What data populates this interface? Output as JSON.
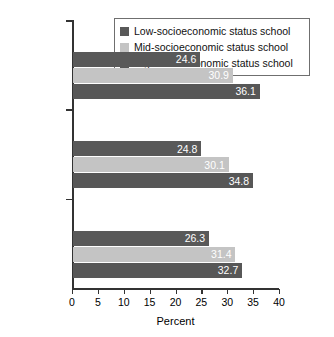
{
  "chart_data": {
    "type": "bar",
    "orientation": "horizontal",
    "title": "",
    "subtitle": "",
    "xlabel": "Percent",
    "ylabel": "",
    "xlim": [
      0,
      40
    ],
    "xticks": [
      0,
      5,
      10,
      15,
      20,
      25,
      30,
      35,
      40
    ],
    "grid": false,
    "legend_position": "top-right",
    "categories": [
      "8th grade",
      "10th grade",
      "12th grade"
    ],
    "series": [
      {
        "name": "Low-socioeconomic status school",
        "color": "#595959",
        "values": [
          24.6,
          24.8,
          26.3
        ]
      },
      {
        "name": "Mid-socioeconomic status school",
        "color": "#c4c4c4",
        "values": [
          30.9,
          30.1,
          31.4
        ]
      },
      {
        "name": "High-socioeconomic status school",
        "color": "#575757",
        "values": [
          36.1,
          34.8,
          32.7
        ]
      }
    ],
    "value_labels": {
      "8th grade": [
        "24.6",
        "30.9",
        "36.1"
      ],
      "10th grade": [
        "24.8",
        "30.1",
        "34.8"
      ],
      "12th grade": [
        "26.3",
        "31.4",
        "32.7"
      ]
    },
    "axis_color": "#333333",
    "background": "#ffffff"
  }
}
